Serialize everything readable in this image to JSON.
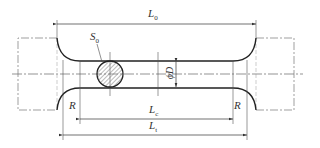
{
  "diagram": {
    "type": "tensile-specimen-drawing",
    "labels": {
      "L0": {
        "main": "L",
        "sub": "0"
      },
      "S0": {
        "main": "S",
        "sub": "0"
      },
      "D": "ϕD",
      "Lc": {
        "main": "L",
        "sub": "c"
      },
      "Lt": {
        "main": "L",
        "sub": "t"
      },
      "R_left": "R",
      "R_right": "R"
    },
    "colors": {
      "line": "#333333",
      "thin": "#555555",
      "hatch": "#888888"
    }
  }
}
